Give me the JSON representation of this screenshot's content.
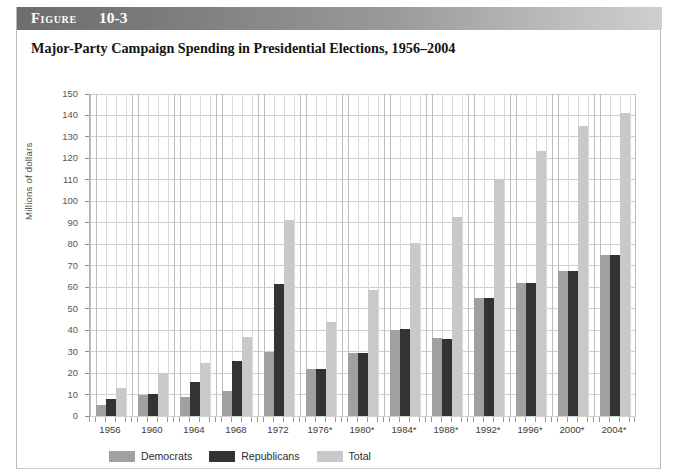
{
  "figure": {
    "label": "Figure",
    "number": "10-3",
    "caption": "Major-Party Campaign Spending in Presidential Elections, 1956–2004"
  },
  "chart_data": {
    "type": "bar",
    "title": "Major-Party Campaign Spending in Presidential Elections, 1956–2004",
    "xlabel": "",
    "ylabel": "Millions of dollars",
    "ylim": [
      0,
      150
    ],
    "ytick_step": 10,
    "yticks": [
      0,
      10,
      20,
      30,
      40,
      50,
      60,
      70,
      80,
      90,
      100,
      110,
      120,
      130,
      140,
      150
    ],
    "grid": true,
    "legend_position": "bottom-left",
    "categories": [
      "1956",
      "1960",
      "1964",
      "1968",
      "1972",
      "1976*",
      "1980*",
      "1984*",
      "1988*",
      "1992*",
      "1996*",
      "2000*",
      "2004*"
    ],
    "series": [
      {
        "name": "Democrats",
        "color": "#a0a0a0",
        "values": [
          5.1,
          9.8,
          8.8,
          11.6,
          30.0,
          21.8,
          29.4,
          40.0,
          36.5,
          55.2,
          61.8,
          67.6,
          75.0
        ]
      },
      {
        "name": "Republicans",
        "color": "#333333",
        "values": [
          7.8,
          10.1,
          16.0,
          25.4,
          61.4,
          21.8,
          29.2,
          40.4,
          36.0,
          55.2,
          61.8,
          67.6,
          75.0
        ]
      },
      {
        "name": "Total",
        "color": "#c9c9c9",
        "values": [
          12.9,
          19.9,
          24.8,
          37.0,
          91.4,
          43.6,
          58.6,
          80.4,
          92.5,
          110.4,
          123.6,
          135.2,
          141.0
        ]
      }
    ]
  },
  "legend": {
    "items": [
      {
        "label": "Democrats",
        "color": "#a0a0a0"
      },
      {
        "label": "Republicans",
        "color": "#333333"
      },
      {
        "label": "Total",
        "color": "#c9c9c9"
      }
    ]
  }
}
